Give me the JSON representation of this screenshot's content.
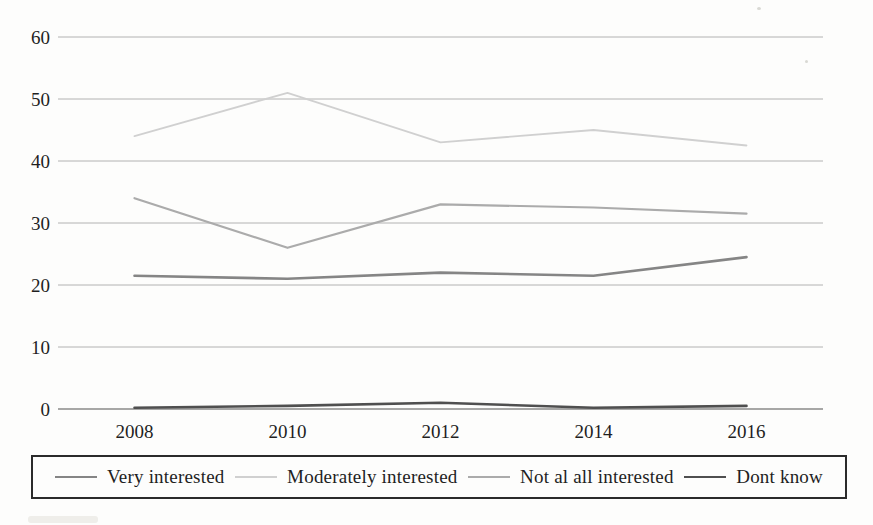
{
  "chart_data": {
    "type": "line",
    "categories": [
      "2008",
      "2010",
      "2012",
      "2014",
      "2016"
    ],
    "yticks": [
      0,
      10,
      20,
      30,
      40,
      50,
      60
    ],
    "ylim": [
      0,
      60
    ],
    "grid": true,
    "legend_position": "bottom-box",
    "gridline_color": "#b2b2b2",
    "axis_line_color": "#8a8a8a",
    "text_color": "#1f1f1f",
    "series": [
      {
        "name": "Very interested",
        "values": [
          21.5,
          21,
          22,
          21.5,
          24.5
        ],
        "color": "#858585",
        "width": 2.6
      },
      {
        "name": "Moderately interested",
        "values": [
          44,
          51,
          43,
          45,
          42.5
        ],
        "color": "#d0d0d0",
        "width": 1.8
      },
      {
        "name": "Not al all interested",
        "values": [
          34,
          26,
          33,
          32.5,
          31.5
        ],
        "color": "#ababab",
        "width": 2.2
      },
      {
        "name": "Dont know",
        "values": [
          0.2,
          0.5,
          1,
          0.2,
          0.5
        ],
        "color": "#4f4f4f",
        "width": 2.6
      }
    ]
  }
}
